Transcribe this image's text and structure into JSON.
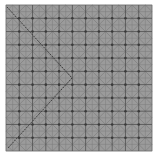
{
  "figure": {
    "width": 158,
    "height": 156,
    "background": "#ffffff",
    "panel": {
      "x": 6,
      "y": 5,
      "width": 146,
      "height": 146,
      "fill": "#9b9b9b",
      "border": "#7a7a7a"
    },
    "grid": {
      "cells": 11,
      "major_color": "#4f4f4f",
      "minor_color": "#7d7d7d",
      "diagonal_color": "#6e6e6e"
    },
    "path": {
      "color": "#3d3d3d",
      "points": [
        [
          7,
          7
        ],
        [
          72,
          78
        ],
        [
          8,
          148
        ]
      ]
    }
  }
}
